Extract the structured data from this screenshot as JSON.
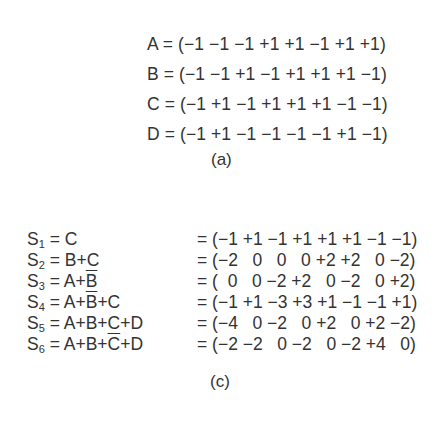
{
  "part_a": {
    "vectors": [
      {
        "name": "A",
        "line": "A = (−1 −1 −1 +1 +1 −1 +1 +1)",
        "values": [
          -1,
          -1,
          -1,
          1,
          1,
          -1,
          1,
          1
        ]
      },
      {
        "name": "B",
        "line": "B = (−1 −1 +1 −1 +1 +1 +1 −1)",
        "values": [
          -1,
          -1,
          1,
          -1,
          1,
          1,
          1,
          -1
        ]
      },
      {
        "name": "C",
        "line": "C = (−1 +1 −1 +1 +1 +1 −1 −1)",
        "values": [
          -1,
          1,
          -1,
          1,
          1,
          1,
          -1,
          -1
        ]
      },
      {
        "name": "D",
        "line": "D = (−1 +1 −1 −1 −1 −1 +1 −1)",
        "values": [
          -1,
          1,
          -1,
          -1,
          -1,
          -1,
          1,
          -1
        ]
      }
    ],
    "caption": "(a)"
  },
  "part_c": {
    "sums": [
      {
        "label": "S",
        "sub": "1",
        "pre": " = C",
        "bar": "",
        "post": "",
        "rhs": "= (−1 +1 −1 +1 +1 +1 −1 −1)",
        "values": [
          -1,
          1,
          -1,
          1,
          1,
          1,
          -1,
          -1
        ]
      },
      {
        "label": "S",
        "sub": "2",
        "pre": " = B+C",
        "bar": "",
        "post": "",
        "rhs": "= (−2   0   0   0 +2 +2   0 −2)",
        "values": [
          -2,
          0,
          0,
          0,
          2,
          2,
          0,
          -2
        ]
      },
      {
        "label": "S",
        "sub": "3",
        "pre": " = A+",
        "bar": "B",
        "post": "",
        "rhs": "= (  0   0 −2 +2   0 −2   0 +2)",
        "values": [
          0,
          0,
          -2,
          2,
          0,
          -2,
          0,
          2
        ]
      },
      {
        "label": "S",
        "sub": "4",
        "pre": " = A+",
        "bar": "B",
        "post": "+C",
        "rhs": "= (−1 +1 −3 +3 +1 −1 −1 +1)",
        "values": [
          -1,
          1,
          -3,
          3,
          1,
          -1,
          -1,
          1
        ]
      },
      {
        "label": "S",
        "sub": "5",
        "pre": " = A+B+C+D",
        "bar": "",
        "post": "",
        "rhs": "= (−4   0 −2   0 +2   0 +2 −2)",
        "values": [
          -4,
          0,
          -2,
          0,
          2,
          0,
          2,
          -2
        ]
      },
      {
        "label": "S",
        "sub": "6",
        "pre": " = A+B+",
        "bar": "C",
        "post": "+D",
        "rhs": "= (−2 −2   0 −2   0 −2 +4   0)",
        "values": [
          -2,
          -2,
          0,
          -2,
          0,
          -2,
          4,
          0
        ]
      }
    ],
    "caption": "(c)"
  }
}
